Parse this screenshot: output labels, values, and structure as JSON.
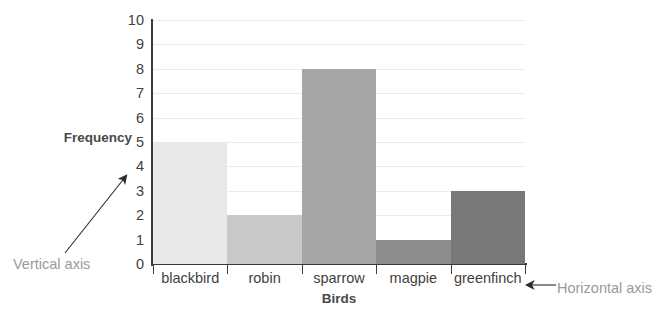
{
  "chart_data": {
    "type": "bar",
    "title": "",
    "xlabel": "Birds",
    "ylabel": "Frequency",
    "categories": [
      "blackbird",
      "robin",
      "sparrow",
      "magpie",
      "greenfinch"
    ],
    "values": [
      5,
      2,
      8,
      1,
      3
    ],
    "ylim": [
      0,
      10
    ],
    "ytick_labels": [
      "10",
      "9",
      "8",
      "7",
      "6",
      "5",
      "4",
      "3",
      "2",
      "1",
      "0"
    ],
    "ytick_values": [
      10,
      9,
      8,
      7,
      6,
      5,
      4,
      3,
      2,
      1,
      0
    ],
    "grid": true,
    "legend": "none",
    "bar_gap": 0,
    "bar_colors": [
      "#e9e9e9",
      "#c9c9c9",
      "#a6a6a6",
      "#8d8d8d",
      "#787878"
    ],
    "series": [
      {
        "name": "Frequency",
        "values": [
          5,
          2,
          8,
          1,
          3
        ]
      }
    ]
  },
  "annotations": {
    "vertical_axis": "Vertical axis",
    "horizontal_axis": "Horizontal axis"
  },
  "colors": {
    "background": "#ffffff",
    "axis": "#3b3b3b",
    "gridline": "#ebebeb",
    "tick_text": "#3f3f3f",
    "axis_label_text": "#4a4a4a",
    "annotation_text": "#9a9a9a"
  },
  "icons": {
    "arrow_up_right": "arrow-up-right-icon",
    "arrow_left": "arrow-left-icon"
  }
}
